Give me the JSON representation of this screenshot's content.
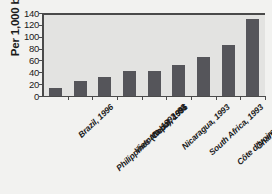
{
  "chart_data": {
    "type": "bar",
    "title": "",
    "xlabel": "",
    "ylabel": "Per 1,000 births",
    "ylim": [
      0,
      140
    ],
    "yticks": [
      0,
      20,
      40,
      60,
      80,
      100,
      120,
      140
    ],
    "grid": false,
    "legend": "none",
    "bar_color": "#55555a",
    "plot_background": "#e3e3e1",
    "figure_background": "#f2f2f0",
    "axis_color": "#4a4a4a",
    "categories": [
      "Brazil, 1996",
      "Philippines (Cebu), 1991",
      "Vietnam, 1992–93",
      "Nepal, 1996",
      "Nicaragua, 1993",
      "South Africa, 1993",
      "Côte d'Ivoire, 1987–88",
      "Ghana, 1987–88",
      "Pakistan, 1991"
    ],
    "values": [
      14,
      25,
      32,
      42,
      42,
      52,
      66,
      86,
      130
    ]
  }
}
